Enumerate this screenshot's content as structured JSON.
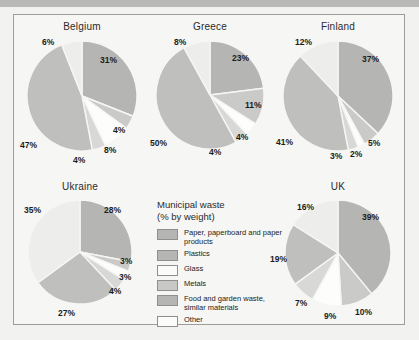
{
  "figure": {
    "background_color": "#f6f6f4",
    "frame_border_color": "#9d9d9b"
  },
  "legend": {
    "title_line1": "Municipal waste",
    "title_line2": "(% by weight)",
    "entries": [
      {
        "label": "Paper, paperboard and paper products",
        "color": "#b5b5b3"
      },
      {
        "label": "Plastics",
        "color": "#b5b5b3"
      },
      {
        "label": "Glass",
        "color": "#fbfbf9"
      },
      {
        "label": "Metals",
        "color": "#c8c8c6"
      },
      {
        "label": "Food and garden waste, similar materials",
        "color": "#b5b5b3"
      },
      {
        "label": "Other",
        "color": "#fbfbf9"
      }
    ]
  },
  "chart_data": {
    "type": "pie",
    "title": "Municipal waste (% by weight)",
    "categories": [
      "Paper, paperboard and paper products",
      "Plastics",
      "Glass",
      "Metals",
      "Food and garden waste, similar materials",
      "Other"
    ],
    "colors": [
      "#b5b5b3",
      "#cacac8",
      "#fdfdfb",
      "#d8d8d6",
      "#bfbfbd",
      "#ededeb"
    ],
    "unit": "%",
    "charts": [
      {
        "title": "Belgium",
        "values": [
          31,
          4,
          8,
          4,
          47,
          6
        ],
        "labels": [
          "31%",
          "4%",
          "8%",
          "4%",
          "47%",
          "6%"
        ]
      },
      {
        "title": "Greece",
        "values": [
          23,
          11,
          4,
          4,
          50,
          8
        ],
        "labels": [
          "23%",
          "11%",
          "4%",
          "4%",
          "50%",
          "8%"
        ]
      },
      {
        "title": "Finland",
        "values": [
          37,
          5,
          2,
          3,
          41,
          12
        ],
        "labels": [
          "37%",
          "5%",
          "2%",
          "3%",
          "41%",
          "12%"
        ]
      },
      {
        "title": "Ukraine",
        "values": [
          28,
          3,
          3,
          4,
          27,
          35
        ],
        "labels": [
          "28%",
          "3%",
          "3%",
          "4%",
          "27%",
          "35%"
        ]
      },
      {
        "title": "UK",
        "values": [
          39,
          10,
          9,
          7,
          19,
          16
        ],
        "labels": [
          "39%",
          "10%",
          "9%",
          "7%",
          "19%",
          "16%"
        ]
      }
    ]
  }
}
